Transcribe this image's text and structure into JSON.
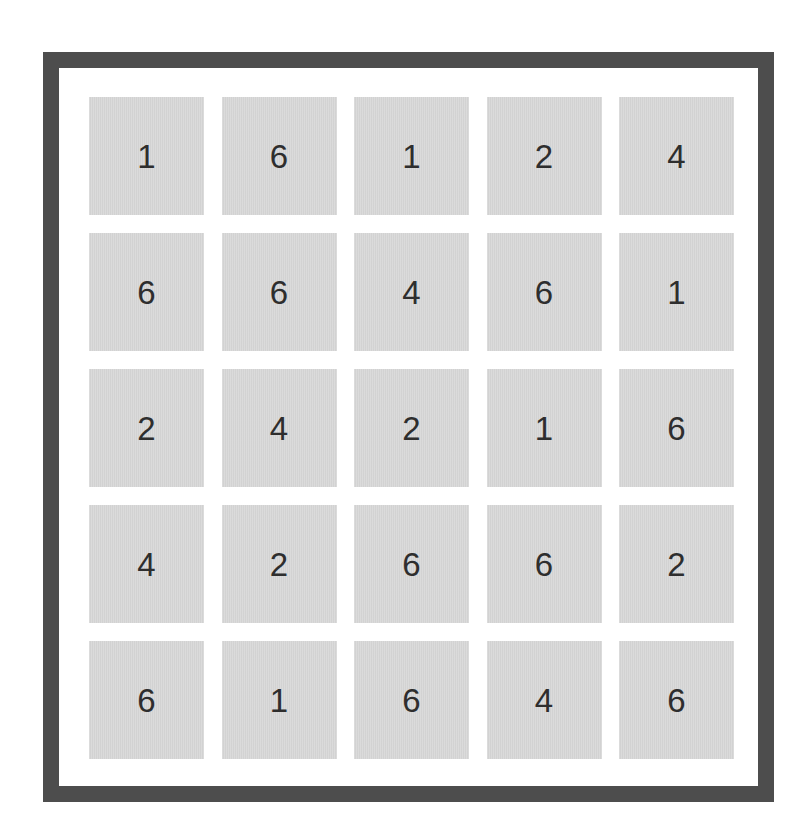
{
  "board": {
    "rows": 5,
    "cols": 5,
    "colors": {
      "frame": "#4d4d4d",
      "tile": "#d9d9d9",
      "digit": "#2e2e2e",
      "background": "#ffffff"
    },
    "cells": [
      [
        "1",
        "6",
        "1",
        "2",
        "4"
      ],
      [
        "6",
        "6",
        "4",
        "6",
        "1"
      ],
      [
        "2",
        "4",
        "2",
        "1",
        "6"
      ],
      [
        "4",
        "2",
        "6",
        "6",
        "2"
      ],
      [
        "6",
        "1",
        "6",
        "4",
        "6"
      ]
    ]
  }
}
